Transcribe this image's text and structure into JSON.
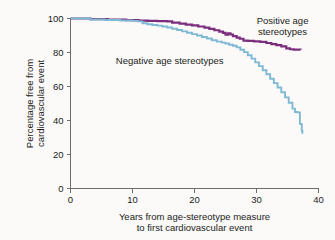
{
  "chart_data": {
    "type": "line",
    "title": "",
    "subtitle": "",
    "xlabel_line1": "Years from age-stereotype measure",
    "xlabel_line2": "to first cardiovascular event",
    "ylabel_line1": "Percentage free from",
    "ylabel_line2": "cardiovascular event",
    "xlim": [
      0,
      40
    ],
    "ylim": [
      0,
      100
    ],
    "xticks": [
      0,
      10,
      20,
      30,
      40
    ],
    "xtick_labels": [
      "0",
      "10",
      "20",
      "30",
      "40"
    ],
    "yticks": [
      0,
      20,
      40,
      60,
      80,
      100
    ],
    "ytick_labels": [
      "0",
      "20",
      "40",
      "60",
      "80",
      "100"
    ],
    "grid": false,
    "legend_position": "inline-annotations",
    "annotations": [
      {
        "name": "positive-age-stereotypes-label",
        "line1": "Positive age",
        "line2": "stereotypes",
        "x": 34.2,
        "y": 96.5,
        "color": "#7B2D7E"
      },
      {
        "name": "negative-age-stereotypes-label",
        "line1": "Negative age stereotypes",
        "line2": "",
        "x": 16.0,
        "y": 73.0,
        "color": "#7FB9D4"
      }
    ],
    "series": [
      {
        "name": "Positive age stereotypes",
        "color": "#7B2D7E",
        "step": "post",
        "x": [
          0.0,
          3.2,
          6.0,
          9.0,
          11.0,
          12.5,
          14.0,
          15.6,
          16.4,
          17.6,
          18.6,
          19.6,
          20.6,
          21.6,
          22.4,
          23.2,
          24.0,
          24.6,
          25.0,
          25.4,
          25.8,
          26.2,
          26.8,
          27.3,
          27.9,
          28.6,
          29.6,
          30.6,
          31.6,
          32.4,
          33.2,
          34.0,
          34.8,
          35.4,
          36.0,
          37.1
        ],
        "y": [
          100.0,
          99.6,
          99.3,
          99.0,
          98.8,
          98.6,
          98.5,
          98.3,
          97.6,
          97.0,
          96.4,
          95.9,
          95.3,
          94.6,
          93.9,
          93.1,
          92.3,
          91.5,
          90.5,
          91.3,
          90.6,
          89.6,
          88.7,
          88.1,
          87.0,
          86.8,
          86.5,
          86.2,
          85.6,
          84.9,
          84.3,
          83.6,
          82.4,
          81.9,
          81.7,
          81.6
        ]
      },
      {
        "name": "Negative age stereotypes",
        "color": "#7FB9D4",
        "step": "post",
        "x": [
          0.0,
          3.2,
          5.5,
          8.0,
          10.0,
          10.9,
          11.6,
          12.4,
          13.2,
          14.0,
          14.8,
          15.6,
          16.4,
          17.2,
          18.0,
          18.8,
          19.6,
          20.4,
          21.2,
          22.0,
          22.8,
          23.6,
          24.4,
          25.0,
          25.6,
          26.2,
          26.8,
          27.4,
          28.0,
          28.6,
          29.2,
          29.8,
          30.4,
          31.0,
          31.6,
          32.2,
          32.8,
          33.4,
          34.0,
          34.6,
          35.2,
          35.8,
          36.2,
          36.6,
          37.0,
          37.3,
          37.4
        ],
        "y": [
          100.0,
          99.4,
          99.1,
          98.8,
          98.6,
          98.3,
          97.2,
          96.6,
          96.2,
          95.8,
          95.3,
          94.7,
          94.0,
          93.2,
          92.4,
          91.6,
          90.8,
          90.0,
          89.1,
          88.2,
          87.2,
          86.4,
          85.8,
          85.3,
          84.6,
          84.0,
          83.0,
          81.6,
          80.2,
          78.4,
          76.4,
          74.2,
          72.0,
          69.6,
          67.2,
          64.6,
          62.0,
          59.4,
          56.6,
          53.6,
          50.4,
          47.0,
          45.0,
          44.8,
          38.0,
          34.0,
          32.2
        ]
      }
    ]
  }
}
